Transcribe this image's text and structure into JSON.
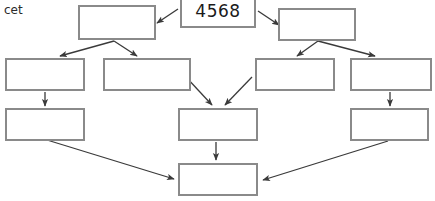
{
  "diagram": {
    "stray_text": "cet",
    "border_color": "#8a8a8a",
    "arrow_color": "#3a3a3a",
    "background": "#ffffff",
    "nodes": [
      {
        "id": "root",
        "label": "4568",
        "x": 180,
        "y": -6,
        "w": 76,
        "h": 34
      },
      {
        "id": "l1a",
        "label": "",
        "x": 78,
        "y": 5,
        "w": 78,
        "h": 35
      },
      {
        "id": "l1b",
        "label": "",
        "x": 278,
        "y": 8,
        "w": 78,
        "h": 33
      },
      {
        "id": "l2a",
        "label": "",
        "x": 5,
        "y": 58,
        "w": 80,
        "h": 33
      },
      {
        "id": "l2b",
        "label": "",
        "x": 103,
        "y": 58,
        "w": 88,
        "h": 33
      },
      {
        "id": "l2c",
        "label": "",
        "x": 255,
        "y": 58,
        "w": 80,
        "h": 33
      },
      {
        "id": "l2d",
        "label": "",
        "x": 350,
        "y": 58,
        "w": 82,
        "h": 33
      },
      {
        "id": "l3a",
        "label": "",
        "x": 5,
        "y": 108,
        "w": 80,
        "h": 33
      },
      {
        "id": "l3b",
        "label": "",
        "x": 178,
        "y": 108,
        "w": 80,
        "h": 33
      },
      {
        "id": "l3c",
        "label": "",
        "x": 350,
        "y": 108,
        "w": 79,
        "h": 33
      },
      {
        "id": "leaf",
        "label": "",
        "x": 178,
        "y": 163,
        "w": 80,
        "h": 33
      }
    ],
    "edges": [
      {
        "id": "root-to-l1a",
        "from": "root",
        "to": "l1a",
        "x1": 178,
        "y1": 9,
        "x2": 157,
        "y2": 23
      },
      {
        "id": "root-to-l1b",
        "from": "root",
        "to": "l1b",
        "x1": 258,
        "y1": 11,
        "x2": 279,
        "y2": 25
      },
      {
        "id": "l1a-to-l2a",
        "from": "l1a",
        "to": "l2a",
        "x1": 114,
        "y1": 41,
        "x2": 60,
        "y2": 56
      },
      {
        "id": "l1a-to-l2b",
        "from": "l1a",
        "to": "l2b",
        "x1": 114,
        "y1": 41,
        "x2": 137,
        "y2": 56
      },
      {
        "id": "l1b-to-l2c",
        "from": "l1b",
        "to": "l2c",
        "x1": 318,
        "y1": 41,
        "x2": 297,
        "y2": 56
      },
      {
        "id": "l1b-to-l2d",
        "from": "l1b",
        "to": "l2d",
        "x1": 318,
        "y1": 41,
        "x2": 375,
        "y2": 56
      },
      {
        "id": "l2a-to-l3a",
        "from": "l2a",
        "to": "l3a",
        "x1": 45,
        "y1": 92,
        "x2": 45,
        "y2": 106
      },
      {
        "id": "l2b-to-l3b",
        "from": "l2b",
        "to": "l3b",
        "x1": 186,
        "y1": 77,
        "x2": 212,
        "y2": 105
      },
      {
        "id": "l2c-to-l3b",
        "from": "l2c",
        "to": "l3b",
        "x1": 252,
        "y1": 77,
        "x2": 225,
        "y2": 105
      },
      {
        "id": "l2d-to-l3c",
        "from": "l2d",
        "to": "l3c",
        "x1": 390,
        "y1": 92,
        "x2": 390,
        "y2": 106
      },
      {
        "id": "l3b-to-leaf",
        "from": "l3b",
        "to": "leaf",
        "x1": 216,
        "y1": 142,
        "x2": 216,
        "y2": 160
      },
      {
        "id": "l3a-to-leaf",
        "from": "l3a",
        "to": "leaf",
        "x1": 47,
        "y1": 140,
        "x2": 174,
        "y2": 179
      },
      {
        "id": "l3c-to-leaf",
        "from": "l3c",
        "to": "leaf",
        "x1": 388,
        "y1": 141,
        "x2": 263,
        "y2": 180
      }
    ]
  }
}
